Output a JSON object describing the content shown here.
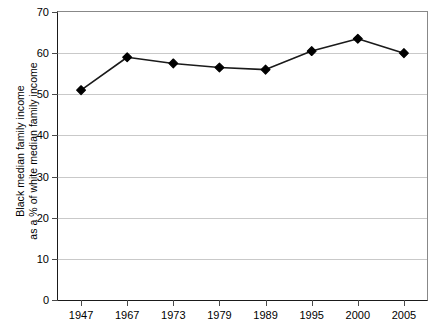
{
  "chart_data": {
    "type": "line",
    "title": "",
    "subtitle": "",
    "xlabel": "",
    "ylabel_lines": [
      "Black median family income",
      "as a % of white median family income"
    ],
    "ylabel": "Black median family income as a % of white median family income",
    "categories": [
      "1947",
      "1967",
      "1973",
      "1979",
      "1989",
      "1995",
      "2000",
      "2005"
    ],
    "values": [
      51,
      59,
      57.5,
      56.5,
      56,
      60.5,
      63.5,
      60
    ],
    "series": [
      {
        "name": "Black median family income as a % of white median family income",
        "values": [
          51,
          59,
          57.5,
          56.5,
          56,
          60.5,
          63.5,
          60
        ]
      }
    ],
    "ylim": [
      0,
      70
    ],
    "y_ticks": [
      0,
      10,
      20,
      30,
      40,
      50,
      60,
      70
    ],
    "y_tick_labels": [
      "0",
      "10",
      "20",
      "30",
      "40",
      "50",
      "60",
      "70"
    ],
    "x_tick_labels": [
      "1947",
      "1967",
      "1973",
      "1979",
      "1989",
      "1995",
      "2000",
      "2005"
    ],
    "grid": "horizontal",
    "legend": "none",
    "marker": "diamond",
    "colors": {
      "line": "#1a1a1a",
      "marker": "#000000",
      "gridline": "#c9c9c9",
      "axis": "#1a1a1a",
      "background": "#ffffff"
    }
  }
}
